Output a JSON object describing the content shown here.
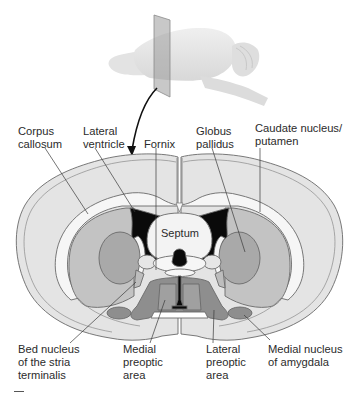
{
  "figure": {
    "type": "coronal brain section diagram",
    "inset": "lateral view of rodent brain with coronal cutting plane",
    "center_label": "Septum",
    "labels_top": [
      {
        "id": "corpus-callosum",
        "lines": [
          "Corpus",
          "callosum"
        ]
      },
      {
        "id": "lateral-ventricle",
        "lines": [
          "Lateral",
          "ventricle"
        ]
      },
      {
        "id": "fornix",
        "lines": [
          "Fornix"
        ]
      },
      {
        "id": "globus-pallidus",
        "lines": [
          "Globus",
          "pallidus"
        ]
      },
      {
        "id": "caudate-putamen",
        "lines": [
          "Caudate nucleus/",
          "putamen"
        ]
      }
    ],
    "labels_bottom": [
      {
        "id": "bed-nucleus",
        "lines": [
          "Bed nucleus",
          "of the stria",
          "terminalis"
        ]
      },
      {
        "id": "medial-preoptic",
        "lines": [
          "Medial",
          "preoptic",
          "area"
        ]
      },
      {
        "id": "lateral-preoptic",
        "lines": [
          "Lateral",
          "preoptic",
          "area"
        ]
      },
      {
        "id": "medial-amygdala",
        "lines": [
          "Medial nucleus",
          "of amygdala"
        ]
      }
    ],
    "colors": {
      "outer_cortex": "#e4e4e4",
      "white_matter": "#f4f4f4",
      "striatum": "#c2c2c2",
      "globus_pallidus": "#a9a9a9",
      "preoptic": "#8e8e8e",
      "ventricle": "#0a0a0a",
      "outline": "#6a6a6a"
    }
  }
}
